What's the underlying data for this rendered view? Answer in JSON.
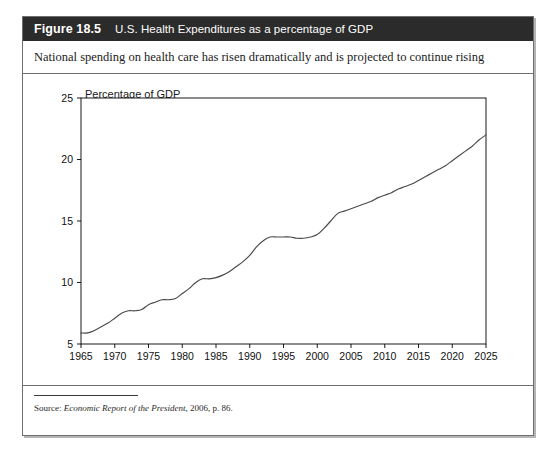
{
  "figure": {
    "number": "Figure 18.5",
    "title": "U.S. Health Expenditures as a percentage of GDP",
    "subtitle": "National spending on health care has risen dramatically and is projected to continue rising",
    "source_prefix": "Source: ",
    "source_italic": "Economic Report of the President",
    "source_suffix": ", 2006, p. 86."
  },
  "colors": {
    "header_bg": "#2b2b2b",
    "header_text": "#ffffff",
    "frame_border": "#6f6f6f",
    "line": "#4a4a4a",
    "axis": "#000000",
    "plot_bg": "#ffffff"
  },
  "chart_data": {
    "type": "line",
    "title": "U.S. Health Expenditures as a percentage of GDP",
    "xlabel": "",
    "ylabel": "Percentage of GDP",
    "xlim": [
      1965,
      2025
    ],
    "ylim": [
      5,
      25
    ],
    "xticks": [
      1965,
      1970,
      1975,
      1980,
      1985,
      1990,
      1995,
      2000,
      2005,
      2010,
      2015,
      2020,
      2025
    ],
    "yticks": [
      5,
      10,
      15,
      20,
      25
    ],
    "xtick_labels": [
      "1965",
      "1970",
      "1975",
      "1980",
      "1985",
      "1990",
      "1995",
      "2000",
      "2005",
      "2010",
      "2015",
      "2020",
      "2025"
    ],
    "ytick_labels": [
      "5",
      "10",
      "15",
      "20",
      "25"
    ],
    "grid": false,
    "legend": false,
    "series": [
      {
        "name": "U.S. Health Expenditures (% of GDP)",
        "x": [
          1965,
          1966,
          1967,
          1968,
          1969,
          1970,
          1971,
          1972,
          1973,
          1974,
          1975,
          1976,
          1977,
          1978,
          1979,
          1980,
          1981,
          1982,
          1983,
          1984,
          1985,
          1986,
          1987,
          1988,
          1989,
          1990,
          1991,
          1992,
          1993,
          1994,
          1995,
          1996,
          1997,
          1998,
          1999,
          2000,
          2001,
          2002,
          2003,
          2004,
          2005,
          2006,
          2007,
          2008,
          2009,
          2010,
          2011,
          2012,
          2013,
          2014,
          2015,
          2016,
          2017,
          2018,
          2019,
          2020,
          2021,
          2022,
          2023,
          2024,
          2025
        ],
        "values": [
          5.9,
          5.9,
          6.1,
          6.4,
          6.7,
          7.1,
          7.5,
          7.7,
          7.7,
          7.8,
          8.2,
          8.4,
          8.6,
          8.6,
          8.7,
          9.1,
          9.5,
          10.0,
          10.3,
          10.3,
          10.4,
          10.6,
          10.9,
          11.3,
          11.7,
          12.2,
          12.9,
          13.4,
          13.7,
          13.7,
          13.7,
          13.7,
          13.6,
          13.6,
          13.7,
          13.9,
          14.4,
          15.0,
          15.6,
          15.8,
          16.0,
          16.2,
          16.4,
          16.6,
          16.9,
          17.1,
          17.3,
          17.6,
          17.8,
          18.0,
          18.3,
          18.6,
          18.9,
          19.2,
          19.5,
          19.9,
          20.3,
          20.7,
          21.1,
          21.6,
          22.0
        ]
      }
    ]
  }
}
